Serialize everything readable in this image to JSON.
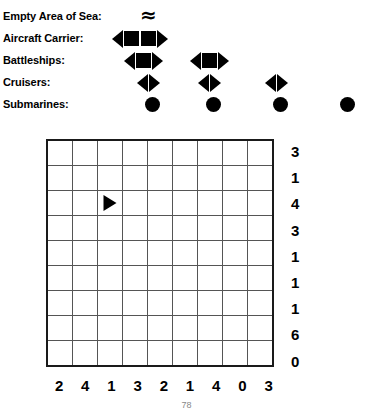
{
  "legend": {
    "rows": [
      {
        "label": "Empty Area of Sea:",
        "icon": "sea-wave-icon",
        "glyph": "≈",
        "type": "wave",
        "count": 1,
        "positions": [
          140
        ]
      },
      {
        "label": "Aircraft Carrier:",
        "icon": "aircraft-carrier-icon",
        "type": "ship",
        "length": 4,
        "count": 1,
        "positions": [
          112
        ]
      },
      {
        "label": "Battleships:",
        "icon": "battleship-icon",
        "type": "ship",
        "length": 3,
        "count": 2,
        "positions": [
          124,
          190
        ]
      },
      {
        "label": "Cruisers:",
        "icon": "cruiser-icon",
        "type": "ship",
        "length": 2,
        "count": 3,
        "positions": [
          137,
          198,
          265
        ]
      },
      {
        "label": "Submarines:",
        "icon": "submarine-icon",
        "type": "sub",
        "length": 1,
        "count": 4,
        "positions": [
          145,
          206,
          273,
          340
        ]
      }
    ]
  },
  "board": {
    "columns": 9,
    "rows": 9,
    "row_clues": [
      "3",
      "1",
      "4",
      "3",
      "1",
      "1",
      "1",
      "6",
      "0"
    ],
    "col_clues": [
      "2",
      "4",
      "1",
      "3",
      "2",
      "1",
      "4",
      "0",
      "3"
    ],
    "given_pieces": [
      {
        "row": 2,
        "col": 2,
        "piece": "nose-right",
        "name": "ship-nose-right"
      }
    ]
  },
  "footer": {
    "page_number": "78"
  },
  "colors": {
    "ink": "#000000",
    "grid_line": "#555555",
    "grid_border": "#1a1a1a",
    "page_number": "#888888",
    "background": "#ffffff"
  }
}
